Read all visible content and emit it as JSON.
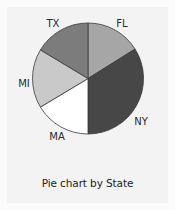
{
  "chart_data": {
    "type": "pie",
    "title": "Pie chart by State",
    "categories": [
      "FL",
      "NY",
      "MA",
      "MI",
      "TX"
    ],
    "values": [
      16,
      34,
      16,
      17,
      17
    ],
    "value_unit": "percent (estimated from slice angles)",
    "start_angle_deg": 0,
    "direction": "clockwise",
    "slice_angles_deg": [
      58,
      122,
      59,
      62,
      59
    ],
    "colors": [
      "#a6a6a6",
      "#474747",
      "#ffffff",
      "#c9c9c9",
      "#7c7c7c"
    ],
    "legend": "none (labels placed outside slices)",
    "grid": false
  },
  "labels": {
    "fl": "FL",
    "ny": "NY",
    "ma": "MA",
    "mi": "MI",
    "tx": "TX"
  },
  "title": "Pie chart by State",
  "colors": {
    "background": "#fbfbfb",
    "panel": "#f3f3f3",
    "slice_stroke": "#3a3a3a"
  }
}
